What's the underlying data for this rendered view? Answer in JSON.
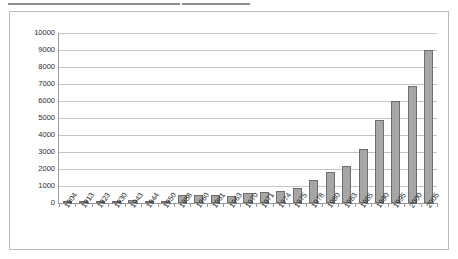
{
  "document": {
    "top_rules": [
      "rule-segment-left",
      "rule-segment-right"
    ]
  },
  "chart_data": {
    "type": "bar",
    "title": "",
    "subtitle": "",
    "xlabel": "",
    "ylabel": "",
    "ylim": [
      0,
      10000
    ],
    "ytick_values": [
      0,
      1000,
      2000,
      3000,
      4000,
      5000,
      6000,
      7000,
      8000,
      9000,
      10000
    ],
    "ytick_labels": [
      "0",
      "1000",
      "2000",
      "3000",
      "4000",
      "5000",
      "6000",
      "7000",
      "8000",
      "9000",
      "10000"
    ],
    "grid": true,
    "legend": false,
    "legend_position": "none",
    "categories": [
      "1904",
      "1913",
      "1923",
      "1930",
      "1943",
      "1944",
      "1950",
      "1958",
      "1960",
      "1961",
      "1963",
      "1970",
      "1971",
      "1974",
      "1975",
      "1978",
      "1980",
      "1983",
      "1985",
      "1990",
      "1995",
      "2000",
      "2005"
    ],
    "values": [
      20,
      20,
      20,
      20,
      150,
      20,
      20,
      450,
      500,
      480,
      420,
      600,
      620,
      700,
      900,
      1350,
      1800,
      2150,
      3200,
      4900,
      6000,
      6900,
      9000
    ],
    "series": [
      {
        "name": "series-1",
        "values": [
          20,
          20,
          20,
          20,
          150,
          20,
          20,
          450,
          500,
          480,
          420,
          600,
          620,
          700,
          900,
          1350,
          1800,
          2150,
          3200,
          4900,
          6000,
          6900,
          9000
        ]
      }
    ],
    "bar_fill_color": "#a6a6a6",
    "bar_border_color": "#6e6e6e",
    "gridline_color": "#c4c4c4",
    "axis_color": "#9a9a9a",
    "plot_background": "#ffffff",
    "frame_border_color": "#b9b9b9"
  }
}
